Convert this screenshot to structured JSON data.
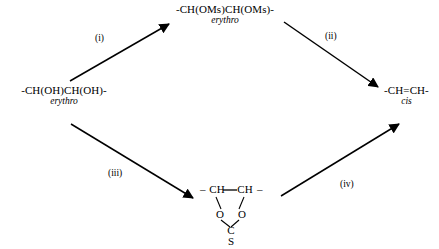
{
  "scheme": {
    "type": "reaction-scheme",
    "layout": "rhombus",
    "description": "Two-route conversion of an erythro-diol to a cis-alkene",
    "nodes": {
      "start": {
        "formula": "-CH(OH)CH(OH)-",
        "descriptor": "erythro"
      },
      "top_intermediate": {
        "formula": "-CH(OMs)CH(OMs)-",
        "descriptor": "erythro"
      },
      "product": {
        "formula": "-CH=CH-",
        "descriptor": "cis"
      },
      "bottom_intermediate": {
        "left_bond": "–",
        "carbon_left": "CH",
        "carbon_right": "CH",
        "right_bond": "–",
        "oxygen_left": "O",
        "oxygen_right": "O",
        "carbonyl_carbon": "C",
        "sulfur": "S"
      }
    },
    "arrows": [
      {
        "id": "i",
        "label": "(i)",
        "from": "start",
        "to": "top_intermediate"
      },
      {
        "id": "ii",
        "label": "(ii)",
        "from": "top_intermediate",
        "to": "product"
      },
      {
        "id": "iii",
        "label": "(iii)",
        "from": "start",
        "to": "bottom_intermediate"
      },
      {
        "id": "iv",
        "label": "(iv)",
        "from": "bottom_intermediate",
        "to": "product"
      }
    ],
    "colors": {
      "ink": "#000000",
      "background": "#ffffff"
    }
  }
}
